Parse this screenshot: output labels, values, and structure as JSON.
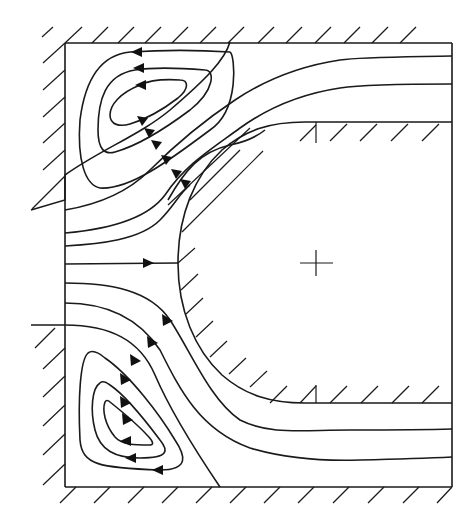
{
  "figure": {
    "type": "streamline-diagram",
    "colors": {
      "line": "#1a1a1a",
      "background": "#ffffff"
    },
    "domain_box": {
      "left": 65,
      "top": 43,
      "right": 452,
      "bottom": 487
    },
    "obstacle": {
      "nose_x": 178,
      "center_y": 263,
      "top_y": 122,
      "bottom_y": 403,
      "center_marker": "cross"
    },
    "vortices": [
      {
        "position": "upper-left",
        "rotation": "counter-clockwise",
        "closed_loops": 3
      },
      {
        "position": "lower-left",
        "rotation": "clockwise",
        "closed_loops": 3
      }
    ],
    "channels": [
      {
        "position": "upper",
        "streamlines": 2
      },
      {
        "position": "lower",
        "streamlines": 2
      }
    ]
  }
}
